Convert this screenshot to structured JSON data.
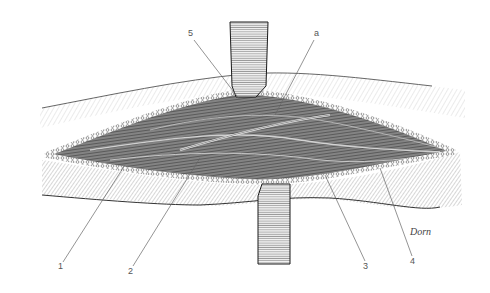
{
  "figure": {
    "type": "surgical anatomical line illustration",
    "signature": "Dorn",
    "labels": [
      {
        "id": "1",
        "text": "1",
        "x": 60,
        "y": 267
      },
      {
        "id": "2",
        "text": "2",
        "x": 130,
        "y": 272
      },
      {
        "id": "3",
        "text": "3",
        "x": 363,
        "y": 267
      },
      {
        "id": "4",
        "text": "4",
        "x": 410,
        "y": 262
      },
      {
        "id": "5",
        "text": "5",
        "x": 190,
        "y": 34
      },
      {
        "id": "a",
        "text": "a",
        "x": 314,
        "y": 34
      }
    ],
    "colors": {
      "ink": "#1a1a1a",
      "shade": "#6b6b6b",
      "light": "#cfcfcf",
      "paper": "#ffffff"
    }
  }
}
